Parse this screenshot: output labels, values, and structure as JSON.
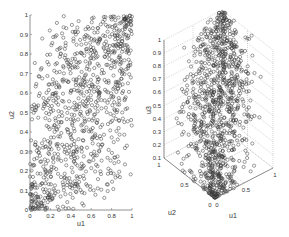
{
  "chart_data": [
    {
      "type": "scatter",
      "title": "",
      "xlabel": "u1",
      "ylabel": "u2",
      "xlim": [
        0,
        1
      ],
      "ylim": [
        0,
        1
      ],
      "x_ticks": [
        "0",
        "0.2",
        "0.4",
        "0.6",
        "0.8",
        "1"
      ],
      "y_ticks": [
        "0",
        "0.1",
        "0.2",
        "0.3",
        "0.4",
        "0.5",
        "0.6",
        "0.7",
        "0.8",
        "0.9",
        "1"
      ],
      "grid": false,
      "marker": "open circle",
      "n_points_approx": 1000,
      "description": "Samples of (u1,u2) from a copula; points denser near (0,0) and (1,1) corners, spread over the unit square"
    },
    {
      "type": "scatter3d",
      "title": "",
      "xlabel": "u1",
      "ylabel": "u2",
      "zlabel": "u3",
      "xlim": [
        0,
        1
      ],
      "ylim": [
        0,
        1
      ],
      "zlim": [
        0.1,
        1
      ],
      "x_ticks": [
        "0",
        "0.5",
        "1"
      ],
      "y_ticks": [
        "0",
        "0.5",
        "1"
      ],
      "z_ticks": [
        "0.1",
        "0.2",
        "0.3",
        "0.4",
        "0.5",
        "0.6",
        "0.7",
        "0.8",
        "0.9",
        "1"
      ],
      "grid": true,
      "marker": "open circle",
      "n_points_approx": 1000,
      "description": "3D scatter of (u1,u2,u3) copula samples; cloud concentrated along main diagonal from (0,0,0) to (1,1,1)"
    }
  ],
  "plot1": {
    "xlabel": "u1",
    "ylabel": "u2",
    "xticks": [
      "0",
      "0.2",
      "0.4",
      "0.6",
      "0.8",
      "1"
    ],
    "yticks": [
      "0",
      "0.1",
      "0.2",
      "0.3",
      "0.4",
      "0.5",
      "0.6",
      "0.7",
      "0.8",
      "0.9",
      "1"
    ]
  },
  "plot2": {
    "xlabel": "u1",
    "ylabel": "u2",
    "zlabel": "u3",
    "u1ticks": [
      "0",
      "0.5",
      "1"
    ],
    "u2ticks": [
      "0",
      "0.5",
      "1"
    ],
    "zticks": [
      "0.1",
      "0.2",
      "0.3",
      "0.4",
      "0.5",
      "0.6",
      "0.7",
      "0.8",
      "0.9",
      "1"
    ]
  },
  "colors": {
    "marker": "#3a3a3a",
    "axis": "#555555",
    "grid": "#aaaaaa"
  }
}
